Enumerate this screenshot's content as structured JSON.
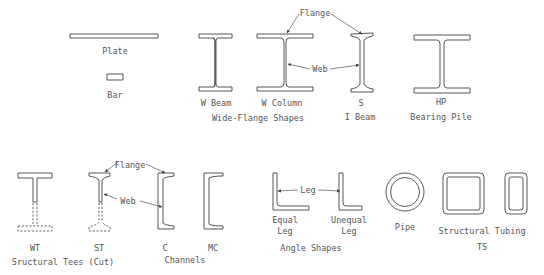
{
  "diagram": {
    "stroke_color": "#444444",
    "text_color": "#555555",
    "background": "#ffffff"
  },
  "labels": {
    "plate": "Plate",
    "bar": "Bar",
    "w_beam": "W Beam",
    "w_column": "W Column",
    "wide_flange_group": "Wide-Flange Shapes",
    "s": "S",
    "i_beam": "I Beam",
    "hp": "HP",
    "bearing_pile": "Bearing Pile",
    "wt": "WT",
    "st": "ST",
    "tees_group": "Sructural Tees (Cut)",
    "c": "C",
    "mc": "MC",
    "channels_group": "Channels",
    "equal_leg_1": "Equal",
    "equal_leg_2": "Leg",
    "unequal_leg_1": "Unequal",
    "unequal_leg_2": "Leg",
    "angle_group": "Angle Shapes",
    "pipe": "Pipe",
    "tubing": "Structural Tubing",
    "ts": "TS"
  },
  "callouts": {
    "flange_top": "Flange",
    "web_top": "Web",
    "flange_bottom": "Flange",
    "web_bottom": "Web",
    "leg": "Leg"
  },
  "shapes": [
    {
      "id": "plate",
      "group": "Plate"
    },
    {
      "id": "bar",
      "group": "Bar"
    },
    {
      "id": "w-beam",
      "group": "Wide-Flange Shapes"
    },
    {
      "id": "w-column",
      "group": "Wide-Flange Shapes"
    },
    {
      "id": "s-beam",
      "group": "I Beam"
    },
    {
      "id": "hp",
      "group": "Bearing Pile"
    },
    {
      "id": "wt",
      "group": "Sructural Tees (Cut)"
    },
    {
      "id": "st",
      "group": "Sructural Tees (Cut)"
    },
    {
      "id": "c",
      "group": "Channels"
    },
    {
      "id": "mc",
      "group": "Channels"
    },
    {
      "id": "equal-leg-angle",
      "group": "Angle Shapes"
    },
    {
      "id": "unequal-leg-angle",
      "group": "Angle Shapes"
    },
    {
      "id": "pipe",
      "group": "Pipe"
    },
    {
      "id": "ts-square",
      "group": "Structural Tubing"
    },
    {
      "id": "ts-rect",
      "group": "Structural Tubing"
    }
  ]
}
